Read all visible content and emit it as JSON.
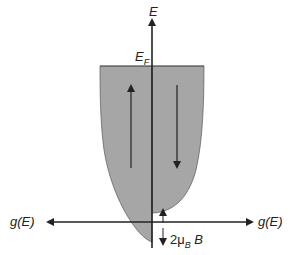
{
  "diagram": {
    "axis_labels": {
      "energy": "E",
      "fermi_level": "E",
      "fermi_sub": "F",
      "dos_left": "g(E)",
      "dos_right": "g(E)"
    },
    "splitting_label": {
      "prefix": "2μ",
      "sub": "B",
      "suffix": " B"
    },
    "arrows": {
      "left_band": "spin-up",
      "right_band": "spin-down"
    },
    "colors": {
      "fill": "#a6a6a6",
      "line": "#222222",
      "background": "#ffffff"
    }
  }
}
